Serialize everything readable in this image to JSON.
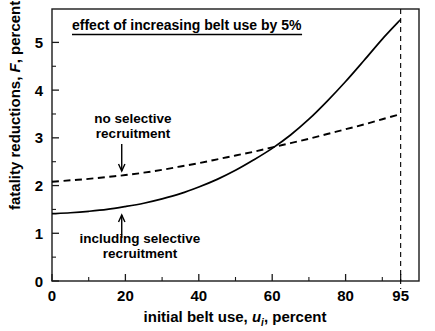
{
  "chart_data": {
    "type": "line",
    "title": "effect of increasing belt use by 5%",
    "title_underlined": true,
    "xlabel_parts": {
      "pre": "initial belt use, ",
      "symbol": "u",
      "subscript": "i",
      "post": ", percent"
    },
    "xlabel": "initial belt use, u_i, percent",
    "ylabel_parts": {
      "pre": "fatality reductions, ",
      "symbol": "F",
      "post": ", percent"
    },
    "ylabel": "fatality reductions, F, percent",
    "xlim": [
      0,
      100
    ],
    "ylim": [
      0,
      5.7
    ],
    "xticks_major": [
      0,
      20,
      40,
      60,
      80,
      95
    ],
    "xtick_labels": [
      "0",
      "20",
      "40",
      "60",
      "80",
      "95"
    ],
    "xticks_minor": [
      10,
      30,
      50,
      70,
      90
    ],
    "yticks_major": [
      0,
      1,
      2,
      3,
      4,
      5
    ],
    "ytick_labels": [
      "0",
      "1",
      "2",
      "3",
      "4",
      "5"
    ],
    "yticks_minor": [
      0.5,
      1.5,
      2.5,
      3.5,
      4.5
    ],
    "grid": false,
    "legend": "none",
    "series": [
      {
        "name": "no selective recruitment",
        "style": "dashed",
        "color": "#000000",
        "x": [
          0,
          5,
          10,
          15,
          20,
          25,
          30,
          35,
          40,
          45,
          50,
          55,
          60,
          65,
          70,
          75,
          80,
          85,
          90,
          95
        ],
        "y": [
          2.08,
          2.11,
          2.14,
          2.18,
          2.22,
          2.27,
          2.33,
          2.4,
          2.47,
          2.55,
          2.63,
          2.71,
          2.8,
          2.89,
          2.98,
          3.08,
          3.18,
          3.28,
          3.39,
          3.5
        ]
      },
      {
        "name": "including selective recruitment",
        "style": "solid",
        "color": "#000000",
        "x": [
          0,
          5,
          10,
          15,
          20,
          25,
          30,
          35,
          40,
          45,
          50,
          55,
          60,
          65,
          70,
          75,
          80,
          85,
          90,
          95
        ],
        "y": [
          1.41,
          1.43,
          1.46,
          1.5,
          1.56,
          1.63,
          1.72,
          1.83,
          1.97,
          2.13,
          2.32,
          2.54,
          2.78,
          3.06,
          3.39,
          3.77,
          4.18,
          4.62,
          5.07,
          5.48
        ]
      }
    ],
    "crossing_point": {
      "x": 61,
      "y": 2.8
    },
    "vertical_reference_line": {
      "x": 95,
      "style": "dashed"
    },
    "annotations": [
      {
        "id": "no-selective-recruitment",
        "text_lines": [
          "no selective",
          "recruitment"
        ],
        "arrow": "down",
        "target_series": "no selective recruitment",
        "target_x": 19,
        "text_anchor_x": 19,
        "text_anchor_y": 3.45
      },
      {
        "id": "including-selective-recruitment",
        "text_lines": [
          "including selective",
          "recruitment"
        ],
        "arrow": "up",
        "target_series": "including selective recruitment",
        "target_x": 19,
        "text_anchor_x": 22,
        "text_anchor_y": 0.95
      }
    ]
  },
  "colors": {
    "axis": "#1a1a1a",
    "curve": "#000000",
    "background": "#ffffff",
    "text": "#000000"
  }
}
